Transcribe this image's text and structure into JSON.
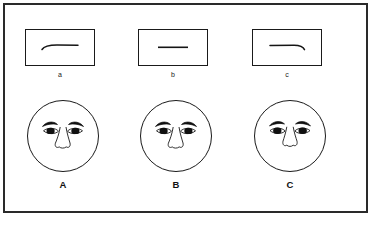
{
  "figure": {
    "background_color": "#ffffff",
    "frame_color": "#2a2a2a",
    "ink_color": "#1a1a1a",
    "layout": "two rows: three boxed mouth lines on top (a, b, c), three faces below (A, B, C)"
  },
  "stimuli": {
    "caption_note": "Each rectangle contains one mouth-line shape",
    "items": [
      {
        "id": "stim-a",
        "label": "a",
        "line_shape": "curved-up-left-end",
        "description": "horizontal line that curves upward at its left end"
      },
      {
        "id": "stim-b",
        "label": "b",
        "line_shape": "straight",
        "description": "perfectly straight horizontal line"
      },
      {
        "id": "stim-c",
        "label": "c",
        "line_shape": "curved-down-right-end",
        "description": "horizontal line that curves downward at its right end"
      }
    ]
  },
  "faces": {
    "caption_note": "Each circle is a face with eyebrows, eyes and nose but no mouth",
    "items": [
      {
        "id": "face-A",
        "label": "A",
        "features": [
          "eyebrow-left",
          "eyebrow-right",
          "eye-left",
          "eye-right",
          "nose"
        ],
        "description": "round face, no mouth drawn"
      },
      {
        "id": "face-B",
        "label": "B",
        "features": [
          "eyebrow-left",
          "eyebrow-right",
          "eye-left",
          "eye-right",
          "nose"
        ],
        "description": "round face, no mouth drawn"
      },
      {
        "id": "face-C",
        "label": "C",
        "features": [
          "eyebrow-left",
          "eyebrow-right",
          "eye-left",
          "eye-right",
          "nose"
        ],
        "description": "round face, no mouth drawn"
      }
    ]
  }
}
